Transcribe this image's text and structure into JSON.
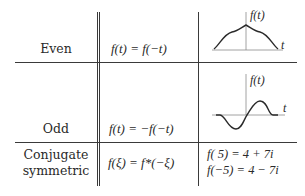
{
  "table": {
    "rows": [
      {
        "name": "Even",
        "condition": "f(t) = f(−t)",
        "example": {
          "type": "plot",
          "kind": "even",
          "y_label": "f(t)",
          "x_label": "t"
        }
      },
      {
        "name": "Odd",
        "condition": "f(t) = −f(−t)",
        "example": {
          "type": "plot",
          "kind": "odd",
          "y_label": "f(t)",
          "x_label": "t"
        }
      },
      {
        "name_line1": "Conjugate",
        "name_line2": "symmetric",
        "condition": "f(ξ) = f*(−ξ)",
        "example": {
          "type": "equations",
          "line1": "f(   5) = 4 + 7i",
          "line2": "f(−5) = 4 − 7i"
        }
      }
    ]
  },
  "colors": {
    "ink": "#2a2a2a",
    "rule": "#3a3a3a",
    "background": "#ffffff"
  }
}
